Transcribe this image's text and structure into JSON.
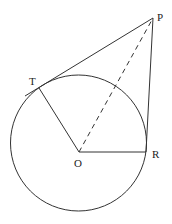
{
  "diagram": {
    "type": "geometry-circle-tangents",
    "labels": {
      "P": "P",
      "T": "T",
      "O": "O",
      "R": "R"
    },
    "points": {
      "P": [
        153,
        18
      ],
      "T": [
        39,
        88
      ],
      "O": [
        79,
        152
      ],
      "R": [
        146,
        152
      ]
    },
    "circle": {
      "cx": 78.5,
      "cy": 143,
      "r": 68
    },
    "segments": [
      {
        "from": "P",
        "to": "T",
        "style": "solid",
        "note": "tangent line extended beyond T"
      },
      {
        "from": "P",
        "to": "R",
        "style": "solid"
      },
      {
        "from": "O",
        "to": "T",
        "style": "solid"
      },
      {
        "from": "O",
        "to": "R",
        "style": "solid"
      },
      {
        "from": "O",
        "to": "P",
        "style": "dashed"
      }
    ],
    "colors": {
      "line": "#333333",
      "background": "#ffffff"
    }
  }
}
